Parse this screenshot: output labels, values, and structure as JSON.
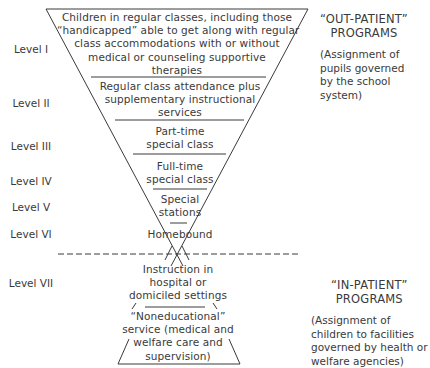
{
  "diagram": {
    "levels": [
      {
        "label": "Level I",
        "text_lines": [
          "Children in regular classes, including those",
          "“handicapped” able to get along with regular",
          "class accommodations with or without",
          "medical or counseling supportive",
          "therapies"
        ]
      },
      {
        "label": "Level II",
        "text_lines": [
          "Regular class attendance plus",
          "supplementary instructional",
          "services"
        ]
      },
      {
        "label": "Level III",
        "text_lines": [
          "Part-time",
          "special class"
        ]
      },
      {
        "label": "Level IV",
        "text_lines": [
          "Full-time",
          "special class"
        ]
      },
      {
        "label": "Level V",
        "text_lines": [
          "Special",
          "stations"
        ]
      },
      {
        "label": "Level VI",
        "text_lines": [
          "Homebound"
        ]
      },
      {
        "label": "Level VII",
        "text_lines": [
          "Instruction in",
          "hospital or",
          "domiciled settings"
        ]
      }
    ],
    "bottom_block": {
      "text_lines": [
        "“Noneducational”",
        "service (medical and",
        "welfare care and",
        "supervision)"
      ]
    },
    "out_patient": {
      "heading_lines": [
        "“OUT-PATIENT”",
        "PROGRAMS"
      ],
      "desc_lines": [
        "(Assignment of",
        "pupils governed",
        "by the school",
        "system)"
      ]
    },
    "in_patient": {
      "heading_lines": [
        "“IN-PATIENT”",
        "PROGRAMS"
      ],
      "desc_lines": [
        "(Assignment of",
        "children to facilities",
        "governed by health or",
        "welfare agencies)"
      ]
    },
    "line_color": "#3a3a3a"
  }
}
